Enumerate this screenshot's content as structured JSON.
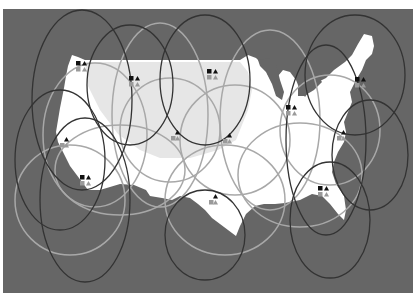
{
  "map": {
    "title": "",
    "background_color": "#666666",
    "land_color": "#ffffff",
    "highlight_region_color": "#e6e6e6",
    "dark_loop_color": "#333333",
    "light_loop_color": "#a8a8a8",
    "marker_black": "#111111",
    "marker_gray": "#9a9a9a"
  },
  "sites": [
    {
      "name": "seattle",
      "x": 81,
      "y": 61,
      "markers": [
        "square",
        "triangle"
      ]
    },
    {
      "name": "montana",
      "x": 134,
      "y": 76,
      "markers": [
        "square",
        "triangle"
      ]
    },
    {
      "name": "minnesota",
      "x": 212,
      "y": 69,
      "markers": [
        "square",
        "triangle"
      ]
    },
    {
      "name": "chicago",
      "x": 291,
      "y": 105,
      "markers": [
        "square",
        "triangle"
      ]
    },
    {
      "name": "boston",
      "x": 360,
      "y": 77,
      "markers": [
        "square",
        "triangle"
      ]
    },
    {
      "name": "virginia",
      "x": 343,
      "y": 130,
      "markers": [
        "triangle"
      ]
    },
    {
      "name": "san-francisco",
      "x": 66,
      "y": 137,
      "markers": [
        "triangle"
      ]
    },
    {
      "name": "denver",
      "x": 177,
      "y": 130,
      "markers": [
        "triangle"
      ]
    },
    {
      "name": "kansas",
      "x": 229,
      "y": 133,
      "markers": [
        "triangle"
      ]
    },
    {
      "name": "los-angeles",
      "x": 85,
      "y": 175,
      "markers": [
        "square",
        "triangle"
      ]
    },
    {
      "name": "texas",
      "x": 215,
      "y": 194,
      "markers": [
        "triangle"
      ]
    },
    {
      "name": "georgia",
      "x": 323,
      "y": 186,
      "markers": [
        "square",
        "triangle"
      ]
    }
  ]
}
